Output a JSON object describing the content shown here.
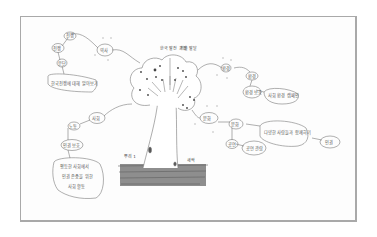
{
  "drawing": {
    "title": "Mind map tree",
    "colors": {
      "frame": "#a9a9a9",
      "ink": "#777777",
      "ground": "#6f6f6f",
      "fruit": "#444444"
    },
    "tree_labels": {
      "top_left": "한국 발전 과정",
      "top_right": "기술 발달",
      "bottom_left": "뿌리 1",
      "bottom_right": "새싹"
    },
    "left_branch_top": {
      "hub": "역사",
      "n1": "전쟁",
      "n2": "전쟁",
      "n3": "분단",
      "leaf": "한국전쟁에 대해 알아보기"
    },
    "left_branch_bottom": {
      "hub": "사회",
      "n1": "노동",
      "n2": "인권 보호",
      "leaf_lines": [
        "평등한 사회에서",
        "인권 존중을 위한",
        "사회 활동"
      ]
    },
    "right_branch_top": {
      "hub": "환경",
      "n1": "환경",
      "n2": "환경 보호",
      "leaf": "사회 환경 캠페인"
    },
    "right_branch_bottom": {
      "hub": "문화",
      "n1": "문화",
      "n2": "공연",
      "n3": "공연 관람",
      "leaf": "다양한 사람들과 함께하기",
      "end": "인권"
    }
  }
}
